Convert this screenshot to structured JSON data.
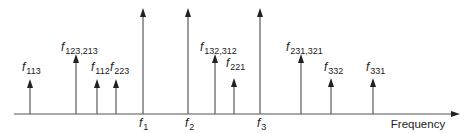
{
  "diagram": {
    "title": "",
    "axis": {
      "label": "Frequency",
      "y": 114,
      "x_start": 14,
      "x_end": 460,
      "color": "#555555"
    },
    "stroke_color": "#666666",
    "arrowhead_color": "#222222",
    "spectral_lines": [
      {
        "id": "f113",
        "name": "f",
        "sub": "113",
        "x": 30,
        "tip_y": 79,
        "label_x": 22,
        "label_y": 71,
        "kind": "intermod"
      },
      {
        "id": "f123_213",
        "name": "f",
        "sub": "123,213",
        "x": 76,
        "tip_y": 54,
        "label_x": 61,
        "label_y": 51,
        "kind": "intermod"
      },
      {
        "id": "f112",
        "name": "f",
        "sub": "112",
        "x": 97,
        "tip_y": 79,
        "label_x": 91,
        "label_y": 71,
        "kind": "intermod"
      },
      {
        "id": "f223",
        "name": "f",
        "sub": "223",
        "x": 116,
        "tip_y": 79,
        "label_x": 110,
        "label_y": 71,
        "kind": "intermod"
      },
      {
        "id": "f1",
        "name": "f",
        "sub": "1",
        "x": 143,
        "tip_y": 8,
        "label_x": 139,
        "label_y": 127,
        "kind": "fundamental"
      },
      {
        "id": "f2",
        "name": "f",
        "sub": "2",
        "x": 188,
        "tip_y": 8,
        "label_x": 185,
        "label_y": 127,
        "kind": "fundamental"
      },
      {
        "id": "f132_312",
        "name": "f",
        "sub": "132,312",
        "x": 215,
        "tip_y": 54,
        "label_x": 200,
        "label_y": 51,
        "kind": "intermod"
      },
      {
        "id": "f221",
        "name": "f",
        "sub": "221",
        "x": 234,
        "tip_y": 78,
        "label_x": 226,
        "label_y": 67,
        "kind": "intermod"
      },
      {
        "id": "f3",
        "name": "f",
        "sub": "3",
        "x": 260,
        "tip_y": 8,
        "label_x": 257,
        "label_y": 127,
        "kind": "fundamental"
      },
      {
        "id": "f231_321",
        "name": "f",
        "sub": "231,321",
        "x": 301,
        "tip_y": 54,
        "label_x": 286,
        "label_y": 51,
        "kind": "intermod"
      },
      {
        "id": "f332",
        "name": "f",
        "sub": "332",
        "x": 331,
        "tip_y": 78,
        "label_x": 324,
        "label_y": 71,
        "kind": "intermod"
      },
      {
        "id": "f331",
        "name": "f",
        "sub": "331",
        "x": 373,
        "tip_y": 78,
        "label_x": 366,
        "label_y": 71,
        "kind": "intermod"
      }
    ]
  }
}
